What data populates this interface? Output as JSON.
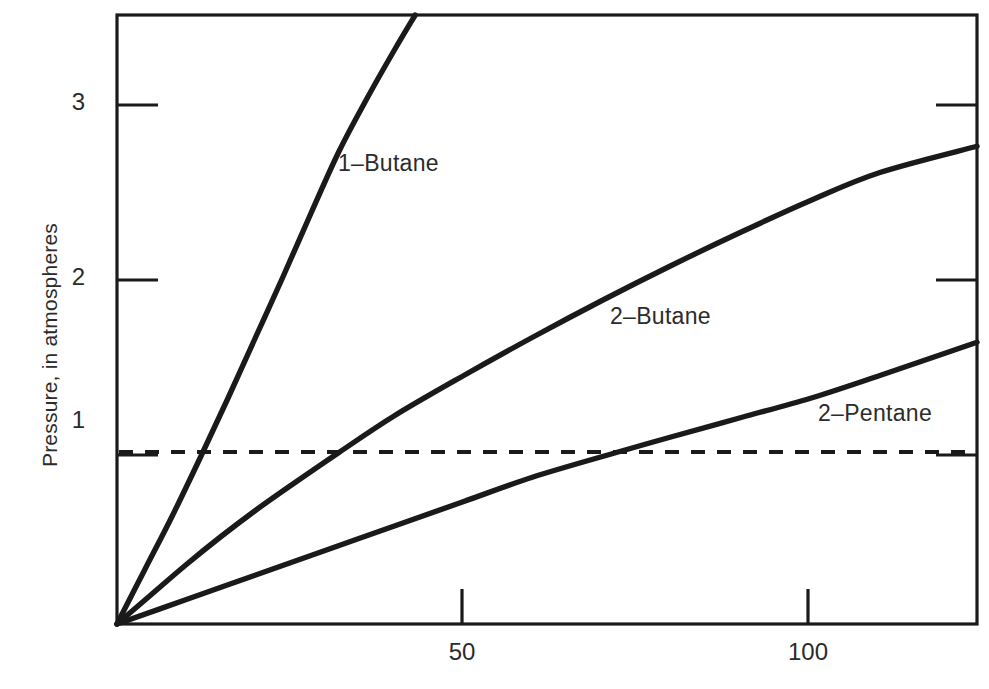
{
  "chart_data": {
    "type": "line",
    "title": "",
    "xlabel": "",
    "ylabel": "Pressure, in atmospheres",
    "xlim": [
      0,
      124
    ],
    "ylim": [
      0,
      3.48
    ],
    "grid": false,
    "legend_position": "inline-curve-labels",
    "x_ticks": [
      {
        "value": 50,
        "label": "50"
      },
      {
        "value": 100,
        "label": "100"
      }
    ],
    "y_ticks": [
      {
        "value": 1,
        "label": "1"
      },
      {
        "value": 2,
        "label": "2"
      },
      {
        "value": 3,
        "label": "3"
      }
    ],
    "annotations": [
      {
        "name": "equilibrium-line",
        "type": "hline",
        "style": "dashed",
        "y": 0.98,
        "label": ""
      }
    ],
    "series": [
      {
        "name": "1-Butane",
        "label": "1–Butane",
        "style": "solid",
        "color": "#1a1a1a",
        "points": [
          [
            0,
            0
          ],
          [
            4,
            0.31
          ],
          [
            8,
            0.62
          ],
          [
            12,
            0.95
          ],
          [
            16,
            1.29
          ],
          [
            20,
            1.64
          ],
          [
            24,
            1.99
          ],
          [
            28,
            2.35
          ],
          [
            32,
            2.7
          ],
          [
            36,
            3.0
          ],
          [
            40,
            3.28
          ],
          [
            43,
            3.48
          ]
        ]
      },
      {
        "name": "2-Butane",
        "label": "2–Butane",
        "style": "solid",
        "color": "#1a1a1a",
        "points": [
          [
            0,
            0
          ],
          [
            5,
            0.17
          ],
          [
            10,
            0.34
          ],
          [
            15,
            0.5
          ],
          [
            20,
            0.65
          ],
          [
            25,
            0.79
          ],
          [
            32,
            0.98
          ],
          [
            40,
            1.19
          ],
          [
            50,
            1.42
          ],
          [
            60,
            1.64
          ],
          [
            70,
            1.85
          ],
          [
            80,
            2.05
          ],
          [
            90,
            2.24
          ],
          [
            100,
            2.42
          ],
          [
            110,
            2.58
          ],
          [
            124,
            2.73
          ]
        ]
      },
      {
        "name": "2-Pentane",
        "label": "2–Pentane",
        "style": "solid",
        "color": "#1a1a1a",
        "points": [
          [
            0,
            0
          ],
          [
            10,
            0.14
          ],
          [
            20,
            0.28
          ],
          [
            30,
            0.42
          ],
          [
            40,
            0.56
          ],
          [
            50,
            0.7
          ],
          [
            60,
            0.84
          ],
          [
            72,
            0.98
          ],
          [
            80,
            1.07
          ],
          [
            90,
            1.18
          ],
          [
            100,
            1.29
          ],
          [
            110,
            1.42
          ],
          [
            124,
            1.61
          ]
        ]
      }
    ]
  },
  "labels": {
    "y_axis_title": "Pressure, in atmospheres",
    "y_tick_1": "1",
    "y_tick_2": "2",
    "y_tick_3": "3",
    "x_tick_50": "50",
    "x_tick_100": "100",
    "series_1": "1–Butane",
    "series_2": "2–Butane",
    "series_3": "2–Pentane"
  },
  "colors": {
    "ink": "#1a1a1a",
    "background": "#ffffff"
  }
}
